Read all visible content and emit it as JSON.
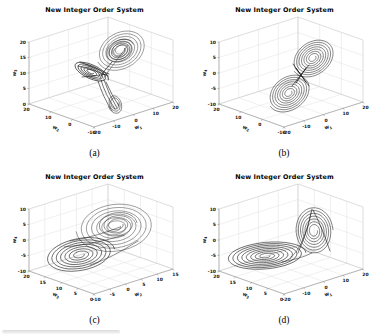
{
  "figure": {
    "layout": "2x2 grid of 3D phase portraits",
    "common_title": "New Integer Order System",
    "subcaptions": [
      "(a)",
      "(b)",
      "(c)",
      "(d)"
    ],
    "colors": {
      "trajectory": "#1a1a1a",
      "grid": "#d9d9d9",
      "axis": "#808080",
      "background": "#ffffff"
    }
  },
  "chart_data": [
    {
      "type": "line",
      "plot": "3d-phase-portrait",
      "title": "New Integer Order System",
      "subcaption": "(a)",
      "xlabel": {
        "base": "w",
        "sub": "1"
      },
      "ylabel": {
        "base": "w",
        "sub": "2"
      },
      "zlabel": {
        "base": "w",
        "sub": "3"
      },
      "x_ticks": [
        -20,
        -10,
        0,
        10,
        20
      ],
      "y_ticks": [
        20,
        10,
        0,
        -10
      ],
      "z_ticks": [
        20,
        15,
        10,
        5,
        0
      ],
      "xlim": [
        -20,
        20
      ],
      "ylim": [
        -10,
        20
      ],
      "zlim": [
        0,
        20
      ],
      "grid": true,
      "description": "Chaotic attractor: large spiral coil upper-right, dark pointed wing to the left, dense tail descending with small loop at bottom",
      "trajectory_shapes": [
        {
          "kind": "spiral",
          "cx": 121,
          "cy": 50,
          "rx": 26,
          "ry": 19,
          "rot": -28,
          "turns": 6.5,
          "r0": 0.15,
          "color": "#3a3a3a",
          "w": 0.5
        },
        {
          "kind": "spiral",
          "cx": 120,
          "cy": 51,
          "rx": 15,
          "ry": 11,
          "rot": -28,
          "turns": 4,
          "r0": 0.35,
          "color": "#1a1a1a",
          "w": 0.55
        },
        {
          "kind": "spiral",
          "cx": 91,
          "cy": 72,
          "rx": 19,
          "ry": 7.5,
          "rot": 25,
          "turns": 5,
          "r0": 0.15,
          "color": "#111111",
          "w": 0.7
        },
        {
          "kind": "curve",
          "pts": [
            78,
            66,
            95,
            70,
            108,
            76
          ],
          "color": "#111111",
          "w": 0.6
        },
        {
          "kind": "curve",
          "pts": [
            80,
            62,
            96,
            68,
            109,
            74
          ],
          "color": "#111111",
          "w": 0.6
        },
        {
          "kind": "curve",
          "pts": [
            82,
            77,
            96,
            76,
            107,
            74
          ],
          "color": "#111111",
          "w": 0.6
        },
        {
          "kind": "curve",
          "pts": [
            112,
            62,
            104,
            70,
            100,
            78
          ],
          "color": "#1a1a1a",
          "w": 0.7
        },
        {
          "kind": "curve",
          "pts": [
            128,
            45,
            112,
            66,
            103,
            79
          ],
          "color": "#333333",
          "w": 0.5
        },
        {
          "kind": "curve",
          "pts": [
            101,
            80,
            105,
            94,
            115,
            109
          ],
          "color": "#161616",
          "w": 0.6
        },
        {
          "kind": "curve",
          "pts": [
            104,
            80,
            109,
            95,
            117,
            108
          ],
          "color": "#161616",
          "w": 0.6
        },
        {
          "kind": "curve",
          "pts": [
            98,
            81,
            103,
            97,
            112,
            111
          ],
          "color": "#161616",
          "w": 0.6
        },
        {
          "kind": "curve",
          "pts": [
            106,
            82,
            112,
            96,
            119,
            106
          ],
          "color": "#161616",
          "w": 0.6
        },
        {
          "kind": "spiral",
          "cx": 115,
          "cy": 104,
          "rx": 7,
          "ry": 10,
          "rot": -20,
          "turns": 2.5,
          "r0": 0.45,
          "color": "#222222",
          "w": 0.55
        }
      ]
    },
    {
      "type": "line",
      "plot": "3d-phase-portrait",
      "title": "New Integer Order System",
      "subcaption": "(b)",
      "xlabel": {
        "base": "w",
        "sub": "1"
      },
      "ylabel": {
        "base": "w",
        "sub": "2"
      },
      "zlabel": {
        "base": "w",
        "sub": "4"
      },
      "x_ticks": [
        -20,
        -10,
        0,
        10,
        20
      ],
      "y_ticks": [
        20,
        10,
        0,
        -10
      ],
      "z_ticks": [
        10,
        5,
        0,
        -5,
        -10
      ],
      "xlim": [
        -20,
        20
      ],
      "ylim": [
        -10,
        20
      ],
      "zlim": [
        -10,
        10
      ],
      "grid": true,
      "description": "Double-scroll figure-eight attractor: two nested spiral rings (upper-right and lower-left) crossing at the center",
      "trajectory_shapes": [
        {
          "kind": "spiral",
          "cx": 123,
          "cy": 58,
          "rx": 23,
          "ry": 17,
          "rot": -36,
          "turns": 7.5,
          "r0": 0.13,
          "color": "#262626",
          "w": 0.55
        },
        {
          "kind": "spiral",
          "cx": 99,
          "cy": 93,
          "rx": 23,
          "ry": 17,
          "rot": -36,
          "turns": 7.5,
          "r0": 0.13,
          "color": "#262626",
          "w": 0.55
        },
        {
          "kind": "curve",
          "pts": [
            106,
            68,
            111,
            75,
            116,
            82
          ],
          "color": "#111111",
          "w": 0.8
        },
        {
          "kind": "curve",
          "pts": [
            116,
            68,
            111,
            75,
            106,
            83
          ],
          "color": "#111111",
          "w": 0.8
        },
        {
          "kind": "curve",
          "pts": [
            103,
            64,
            111,
            76,
            119,
            86
          ],
          "color": "#111111",
          "w": 0.6
        },
        {
          "kind": "curve",
          "pts": [
            119,
            65,
            110,
            76,
            102,
            86
          ],
          "color": "#111111",
          "w": 0.6
        }
      ]
    },
    {
      "type": "line",
      "plot": "3d-phase-portrait",
      "title": "New Integer Order System",
      "subcaption": "(c)",
      "xlabel": {
        "base": "w",
        "sub": "2"
      },
      "ylabel": {
        "base": "w",
        "sub": "3"
      },
      "zlabel": {
        "base": "w",
        "sub": "4"
      },
      "x_ticks": [
        -10,
        -5,
        0,
        5,
        10,
        15
      ],
      "y_ticks": [
        20,
        15,
        10,
        5,
        0
      ],
      "z_ticks": [
        10,
        5,
        0,
        -5,
        -10
      ],
      "xlim": [
        -10,
        15
      ],
      "ylim": [
        0,
        20
      ],
      "zlim": [
        -10,
        10
      ],
      "grid": true,
      "description": "Two large overlapping nested-loop scrolls: lighter wide coil upper-right and darker flatter coil lower-left",
      "trajectory_shapes": [
        {
          "kind": "spiral",
          "cx": 115,
          "cy": 60,
          "rx": 39,
          "ry": 25,
          "rot": -7,
          "turns": 6.5,
          "r0": 0.14,
          "color": "#3d3d3d",
          "w": 0.5
        },
        {
          "kind": "spiral",
          "cx": 117,
          "cy": 58,
          "rx": 20,
          "ry": 13,
          "rot": -7,
          "turns": 3,
          "r0": 0.3,
          "color": "#222222",
          "w": 0.5
        },
        {
          "kind": "spiral",
          "cx": 80,
          "cy": 88,
          "rx": 35,
          "ry": 17,
          "rot": -10,
          "turns": 7,
          "r0": 0.12,
          "color": "#101010",
          "w": 0.6
        },
        {
          "kind": "curve",
          "pts": [
            70,
            74,
            95,
            70,
            120,
            60
          ],
          "color": "#222222",
          "w": 0.5
        },
        {
          "kind": "curve",
          "pts": [
            64,
            80,
            92,
            78,
            124,
            68
          ],
          "color": "#222222",
          "w": 0.5
        },
        {
          "kind": "curve",
          "pts": [
            90,
            98,
            110,
            92,
            138,
            74
          ],
          "color": "#222222",
          "w": 0.5
        }
      ]
    },
    {
      "type": "line",
      "plot": "3d-phase-portrait",
      "title": "New Integer Order System",
      "subcaption": "(d)",
      "xlabel": {
        "base": "w",
        "sub": "1"
      },
      "ylabel": {
        "base": "w",
        "sub": "3"
      },
      "zlabel": {
        "base": "w",
        "sub": "4"
      },
      "x_ticks": [
        -20,
        -10,
        0,
        10,
        20
      ],
      "y_ticks": [
        20,
        15,
        10,
        5,
        0
      ],
      "z_ticks": [
        10,
        5,
        0,
        -5,
        -10
      ],
      "xlim": [
        -20,
        20
      ],
      "ylim": [
        0,
        20
      ],
      "zlim": [
        -10,
        10
      ],
      "grid": true,
      "description": "Flat disk of concentric dark loops at left-center joined to a vertical triangular coil (cone of nested loops) at the right",
      "trajectory_shapes": [
        {
          "kind": "spiral",
          "cx": 76,
          "cy": 89,
          "rx": 40,
          "ry": 14,
          "rot": -5,
          "turns": 8,
          "r0": 0.1,
          "color": "#101010",
          "w": 0.6
        },
        {
          "kind": "spiral",
          "cx": 124,
          "cy": 64,
          "rx": 19,
          "ry": 24,
          "rot": -4,
          "turns": 7,
          "r0": 0.18,
          "color": "#1f1f1f",
          "w": 0.55
        },
        {
          "kind": "curve",
          "pts": [
            108,
            86,
            118,
            62,
            122,
            42
          ],
          "color": "#1a1a1a",
          "w": 0.6
        },
        {
          "kind": "curve",
          "pts": [
            140,
            84,
            132,
            60,
            123,
            43
          ],
          "color": "#1a1a1a",
          "w": 0.6
        },
        {
          "kind": "curve",
          "pts": [
            100,
            92,
            116,
            76,
            121,
            46
          ],
          "color": "#2a2a2a",
          "w": 0.5
        },
        {
          "kind": "curve",
          "pts": [
            92,
            95,
            110,
            92,
            122,
            86
          ],
          "color": "#1a1a1a",
          "w": 0.5
        }
      ]
    }
  ]
}
